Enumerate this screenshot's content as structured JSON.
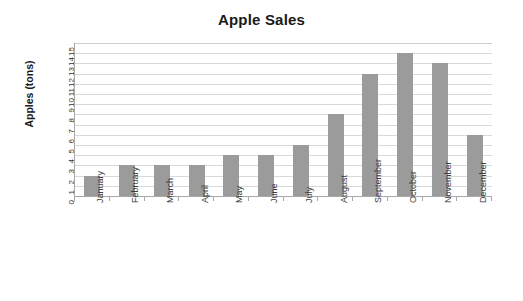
{
  "chart_data": {
    "type": "bar",
    "title": "Apple Sales",
    "xlabel": "",
    "ylabel": "Apples (tons)",
    "categories": [
      "January",
      "February",
      "March",
      "April",
      "May",
      "June",
      "July",
      "August",
      "September",
      "October",
      "November",
      "December"
    ],
    "values": [
      2,
      3,
      3,
      3,
      4,
      4,
      5,
      8,
      12,
      14,
      13,
      6
    ],
    "ylim": [
      0,
      15
    ],
    "ytick_step": 1,
    "ytick_labels": [
      "15",
      "14",
      "13",
      "12",
      "11",
      "10",
      "9",
      "8",
      "7",
      "6",
      "5",
      "4",
      "3",
      "2",
      "1",
      "0"
    ],
    "grid": true,
    "legend": false,
    "series": [
      {
        "name": "Apple Sales",
        "values": [
          2,
          3,
          3,
          3,
          4,
          4,
          5,
          8,
          12,
          14,
          13,
          6
        ],
        "color": "#9b9b9b"
      }
    ],
    "colors": {
      "bar": "#9b9b9b",
      "gridline": "#d9d9d9",
      "axis": "#a8a8a8",
      "text": "#1a1a1a",
      "background": "#ffffff"
    }
  }
}
